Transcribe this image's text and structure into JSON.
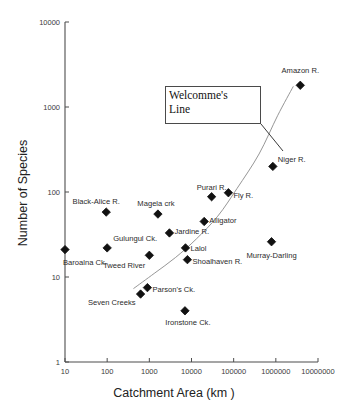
{
  "chart_data": {
    "type": "scatter",
    "title": "",
    "xlabel": "Catchment Area (km )",
    "ylabel": "Number of Species",
    "xscale": "log",
    "yscale": "log",
    "xlim": [
      10,
      10000000
    ],
    "ylim": [
      1,
      10000
    ],
    "grid": false,
    "legend": null,
    "xticks": [
      "10",
      "100",
      "1000",
      "10000",
      "100000",
      "1000000",
      "10000000"
    ],
    "yticks": [
      "1",
      "10",
      "100",
      "1000",
      "10000"
    ],
    "annotations": [
      {
        "name": "welcommes-line-callout",
        "lines": [
          "Welcomme's",
          "Line"
        ],
        "box": {
          "x": 165,
          "y": 86,
          "w": 96,
          "h": 38
        },
        "leader_to": {
          "x": 283,
          "y": 151
        }
      }
    ],
    "trend_curve": {
      "name": "Welcomme's Line",
      "stroke": "#8a8a8a",
      "points": [
        {
          "area": 420,
          "species": 7.3
        },
        {
          "area": 1300,
          "species": 11
        },
        {
          "area": 4200,
          "species": 17
        },
        {
          "area": 13000,
          "species": 28
        },
        {
          "area": 42000,
          "species": 52
        },
        {
          "area": 120000,
          "species": 110
        },
        {
          "area": 400000,
          "species": 280
        },
        {
          "area": 1100000,
          "species": 790
        },
        {
          "area": 2600000,
          "species": 1750
        }
      ]
    },
    "points": [
      {
        "label": "Baroalna Ck.",
        "area": 10,
        "species": 21,
        "label_dx": -2,
        "label_dy": 13,
        "anchor": "left"
      },
      {
        "label": "Black-Alice R.",
        "area": 95,
        "species": 58,
        "label_dx": -10,
        "label_dy": -10,
        "anchor": "center"
      },
      {
        "label": "Gulungul Ck.",
        "area": 100,
        "species": 22,
        "label_dx": 6,
        "label_dy": -9,
        "anchor": "left"
      },
      {
        "label": "Seven Creeks",
        "area": 620,
        "species": 6.3,
        "label_dx": -5,
        "label_dy": 9,
        "anchor": "right"
      },
      {
        "label": "Parson's Ck.",
        "area": 900,
        "species": 7.5,
        "label_dx": 5,
        "label_dy": 2,
        "anchor": "left"
      },
      {
        "label": "Tweed River",
        "area": 1000,
        "species": 18,
        "label_dx": -4,
        "label_dy": 11,
        "anchor": "right"
      },
      {
        "label": "Magela crk",
        "area": 1600,
        "species": 55,
        "label_dx": -2,
        "label_dy": -10,
        "anchor": "center"
      },
      {
        "label": "Jardine R.",
        "area": 3000,
        "species": 33,
        "label_dx": 5,
        "label_dy": -1,
        "anchor": "left"
      },
      {
        "label": "Ironstone Ck.",
        "area": 7000,
        "species": 4.0,
        "label_dx": 3,
        "label_dy": 12,
        "anchor": "center"
      },
      {
        "label": "Lalol",
        "area": 7200,
        "species": 22,
        "label_dx": 5,
        "label_dy": 1,
        "anchor": "left"
      },
      {
        "label": "Shoalhaven R.",
        "area": 8000,
        "species": 16,
        "label_dx": 5,
        "label_dy": 2,
        "anchor": "left"
      },
      {
        "label": "Purari R.",
        "area": 30000,
        "species": 88,
        "label_dx": 0,
        "label_dy": -9,
        "anchor": "center"
      },
      {
        "label": "Alligator",
        "area": 20000,
        "species": 45,
        "label_dx": 5,
        "label_dy": 0,
        "anchor": "left"
      },
      {
        "label": "Fly R.",
        "area": 75000,
        "species": 98,
        "label_dx": 5,
        "label_dy": 3,
        "anchor": "left"
      },
      {
        "label": "Niger R.",
        "area": 850000,
        "species": 200,
        "label_dx": 5,
        "label_dy": -6,
        "anchor": "left"
      },
      {
        "label": "Murray-Darling",
        "area": 790000,
        "species": 26,
        "label_dx": 0,
        "label_dy": 14,
        "anchor": "center"
      },
      {
        "label": "Amazon R.",
        "area": 3800000,
        "species": 1800,
        "label_dx": 0,
        "label_dy": -14,
        "anchor": "center"
      }
    ],
    "marker": {
      "shape": "diamond",
      "size": 4.2,
      "color": "#111111"
    }
  }
}
